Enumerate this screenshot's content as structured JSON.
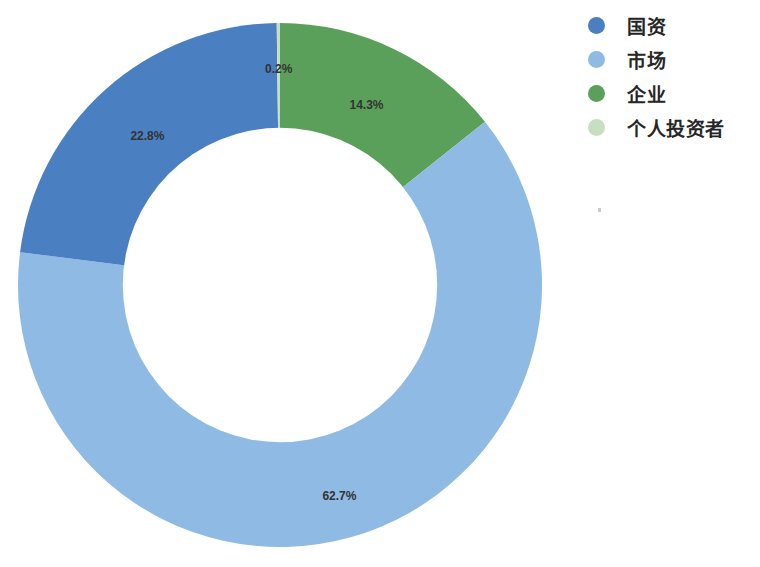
{
  "chart_data": {
    "type": "pie",
    "variant": "donut",
    "title": "",
    "labels": [
      "国资",
      "市场",
      "企业",
      "个人投资者"
    ],
    "values": [
      22.8,
      62.7,
      14.3,
      0.2
    ],
    "value_labels": [
      "22.8%",
      "62.7%",
      "14.3%",
      "0.2%"
    ],
    "colors": [
      "#4a7fc1",
      "#8fbae4",
      "#5aa05a",
      "#c5dfc0"
    ],
    "units": "percent",
    "legend_position": "right",
    "start_angle_deg": -90,
    "direction": "clockwise",
    "hole_ratio": 0.6,
    "grid": false
  },
  "legend": {
    "items": [
      {
        "label": "国资",
        "color": "#4a7fc1",
        "swatch": "circle-swatch"
      },
      {
        "label": "市场",
        "color": "#8fbae4",
        "swatch": "circle-swatch"
      },
      {
        "label": "企业",
        "color": "#5aa05a",
        "swatch": "circle-swatch"
      },
      {
        "label": "个人投资者",
        "color": "#c5dfc0",
        "swatch": "circle-swatch"
      }
    ]
  },
  "slices": [
    {
      "name": "企业",
      "percent_text": "14.3%",
      "color": "#5aa05a",
      "path": "M 280 285 L 280 23 A 262 262 0 0 1 503 407 Z",
      "hole_path": "",
      "label_x": 378,
      "label_y": 97
    },
    {
      "name": "市场",
      "percent_text": "62.7%",
      "color": "#8fbae4",
      "label_x": 334,
      "label_y": 508
    },
    {
      "name": "国资",
      "percent_text": "22.8%",
      "color": "#4a7fc1",
      "label_x": 137,
      "label_y": 125
    },
    {
      "name": "个人投资者",
      "percent_text": "0.2%",
      "color": "#c5dfc0",
      "label_x": 283,
      "label_y": 70
    }
  ]
}
